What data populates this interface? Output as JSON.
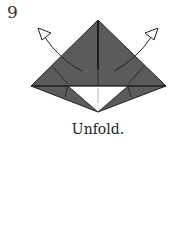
{
  "step_number": "9",
  "caption": "Unfold.",
  "colors": {
    "paper_colored": "#5b5b5b",
    "paper_white": "#ffffff",
    "line": "#222222"
  },
  "icons": {
    "left_arrow": "unfold-arrow-left",
    "right_arrow": "unfold-arrow-right"
  }
}
